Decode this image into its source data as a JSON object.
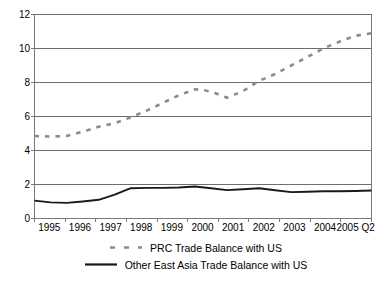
{
  "chart_data": {
    "type": "line",
    "title": "",
    "subtitle": "",
    "xlabel": "",
    "ylabel": "",
    "ylim": [
      0,
      12
    ],
    "yticks": [
      0,
      2,
      4,
      6,
      8,
      10,
      12
    ],
    "ytick_labels": [
      "0",
      "2",
      "4",
      "6",
      "8",
      "10",
      "12"
    ],
    "grid": true,
    "grid_axis": "y",
    "legend_position": "bottom",
    "categories": [
      "1995",
      "1996",
      "1997",
      "1998",
      "1999",
      "2000",
      "2001",
      "2002",
      "2003",
      "2004",
      "2005 Q2"
    ],
    "x_tick_labels": [
      "1995",
      "1996",
      "1997",
      "1998",
      "1999",
      "2000",
      "2001",
      "2002",
      "2003",
      "2004",
      "2005 Q2"
    ],
    "series": [
      {
        "name": "PRC Trade Balance with US",
        "style": "dashed",
        "color": "#8c8c8c",
        "marker": "none",
        "values": [
          4.85,
          4.85,
          5.4,
          5.95,
          6.8,
          7.6,
          7.1,
          8.1,
          9.0,
          10.0,
          10.9
        ],
        "dense_x": [
          1995.0,
          1995.5,
          1996.0,
          1996.5,
          1997.0,
          1997.5,
          1998.0,
          1998.5,
          1999.0,
          1999.5,
          2000.0,
          2000.3,
          2000.6,
          2001.0,
          2001.5,
          2002.0,
          2002.5,
          2003.0,
          2003.5,
          2004.0,
          2004.5,
          2005.0,
          2005.5
        ],
        "dense_y": [
          4.85,
          4.82,
          4.85,
          5.1,
          5.4,
          5.6,
          5.95,
          6.35,
          6.8,
          7.25,
          7.6,
          7.55,
          7.4,
          7.1,
          7.5,
          8.1,
          8.5,
          9.0,
          9.5,
          10.0,
          10.4,
          10.75,
          10.9
        ]
      },
      {
        "name": "Other East Asia Trade Balance with US",
        "style": "solid",
        "color": "#1a1a1a",
        "marker": "none",
        "values": [
          1.05,
          0.92,
          1.1,
          1.78,
          1.8,
          1.88,
          1.67,
          1.78,
          1.55,
          1.6,
          1.65
        ],
        "dense_x": [
          1995.0,
          1995.5,
          1996.0,
          1996.5,
          1997.0,
          1997.5,
          1998.0,
          1998.5,
          1999.0,
          1999.5,
          2000.0,
          2000.5,
          2001.0,
          2001.5,
          2002.0,
          2002.5,
          2003.0,
          2003.5,
          2004.0,
          2004.5,
          2005.0,
          2005.5
        ],
        "dense_y": [
          1.05,
          0.95,
          0.92,
          1.0,
          1.1,
          1.4,
          1.78,
          1.8,
          1.8,
          1.82,
          1.88,
          1.78,
          1.67,
          1.72,
          1.78,
          1.66,
          1.55,
          1.57,
          1.6,
          1.6,
          1.62,
          1.65
        ]
      }
    ]
  },
  "legend": {
    "items": [
      {
        "label": "PRC Trade Balance with US",
        "style": "dashed",
        "color": "#8c8c8c"
      },
      {
        "label": "Other East Asia Trade Balance with US",
        "style": "solid",
        "color": "#1a1a1a"
      }
    ]
  },
  "axes": {
    "axis_color": "#7a7a7a",
    "grid_color": "#6e6e6e",
    "text_color": "#000000"
  }
}
